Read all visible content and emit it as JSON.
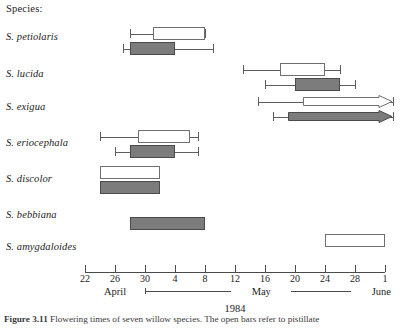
{
  "figure": {
    "species_header": "Species:",
    "year_label": "1984",
    "caption_label": "Figure 3.11",
    "caption_text": "Flowering times of seven willow species. The open bars refer to pistillate"
  },
  "chart_data": {
    "type": "bar",
    "xlabel": "1984",
    "ylabel": "Species",
    "orientation": "horizontal",
    "grid": false,
    "legend": [
      "open bar (pistillate)",
      "filled bar (staminate)"
    ],
    "x_axis": {
      "tick_labels": [
        "22",
        "26",
        "30",
        "4",
        "8",
        "12",
        "16",
        "20",
        "24",
        "28",
        "1"
      ],
      "tick_days": [
        112,
        116,
        120,
        124,
        128,
        132,
        136,
        140,
        144,
        148,
        152
      ],
      "xlim_days": [
        112,
        152
      ],
      "months": [
        {
          "label": "April",
          "start_day": 112,
          "end_day": 120
        },
        {
          "label": "May",
          "start_day": 120,
          "end_day": 151
        },
        {
          "label": "June",
          "start_day": 151,
          "end_day": 152
        }
      ]
    },
    "categories": [
      "S. petiolaris",
      "S. lucida",
      "S. exigua",
      "S. eriocephala",
      "S. discolor",
      "S. bebbiana",
      "S. amygdaloides"
    ],
    "series": [
      {
        "name": "open bar (pistillate)",
        "fill": "#ffffff",
        "bars": [
          {
            "category": "S. petiolaris",
            "box_start_day": 121,
            "box_end_day": 128,
            "whisker_low_day": 118,
            "whisker_high_day": 128,
            "arrow_end": false
          },
          {
            "category": "S. lucida",
            "box_start_day": 138,
            "box_end_day": 144,
            "whisker_low_day": 133,
            "whisker_high_day": 146,
            "arrow_end": false
          },
          {
            "category": "S. exigua",
            "box_start_day": 141,
            "box_end_day": 153,
            "whisker_low_day": 135,
            "whisker_high_day": 153,
            "arrow_end": true
          },
          {
            "category": "S. eriocephala",
            "box_start_day": 119,
            "box_end_day": 126,
            "whisker_low_day": 114,
            "whisker_high_day": 127,
            "arrow_end": false
          },
          {
            "category": "S. discolor",
            "box_start_day": 114,
            "box_end_day": 122,
            "whisker_low_day": null,
            "whisker_high_day": null,
            "arrow_end": false
          },
          {
            "category": "S. bebbiana",
            "box_start_day": null,
            "box_end_day": null,
            "whisker_low_day": null,
            "whisker_high_day": null,
            "arrow_end": false
          },
          {
            "category": "S. amygdaloides",
            "box_start_day": 144,
            "box_end_day": 152,
            "whisker_low_day": null,
            "whisker_high_day": null,
            "arrow_end": false
          }
        ]
      },
      {
        "name": "filled bar (staminate)",
        "fill": "#7c7c7c",
        "bars": [
          {
            "category": "S. petiolaris",
            "box_start_day": 118,
            "box_end_day": 124,
            "whisker_low_day": 117,
            "whisker_high_day": 129,
            "arrow_end": false
          },
          {
            "category": "S. lucida",
            "box_start_day": 140,
            "box_end_day": 146,
            "whisker_low_day": 136,
            "whisker_high_day": 148,
            "arrow_end": false
          },
          {
            "category": "S. exigua",
            "box_start_day": 139,
            "box_end_day": 153,
            "whisker_low_day": 137,
            "whisker_high_day": 153,
            "arrow_end": true
          },
          {
            "category": "S. eriocephala",
            "box_start_day": 118,
            "box_end_day": 124,
            "whisker_low_day": 116,
            "whisker_high_day": 127,
            "arrow_end": false
          },
          {
            "category": "S. discolor",
            "box_start_day": 114,
            "box_end_day": 122,
            "whisker_low_day": null,
            "whisker_high_day": null,
            "arrow_end": false
          },
          {
            "category": "S. bebbiana",
            "box_start_day": 118,
            "box_end_day": 128,
            "whisker_low_day": null,
            "whisker_high_day": null,
            "arrow_end": false
          },
          {
            "category": "S. amygdaloides",
            "box_start_day": null,
            "box_end_day": null,
            "whisker_low_day": null,
            "whisker_high_day": null,
            "arrow_end": false
          }
        ]
      }
    ]
  }
}
